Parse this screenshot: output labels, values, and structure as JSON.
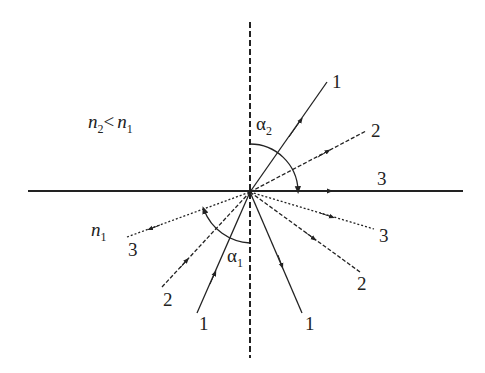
{
  "diagram": {
    "medium_condition": {
      "n": "n",
      "sub_a": "2",
      "op": "<",
      "n2": "n",
      "sub_b": "1"
    },
    "lower_medium": {
      "n": "n",
      "sub": "1"
    },
    "angles": {
      "upper": {
        "symbol": "α",
        "sub": "2"
      },
      "lower": {
        "symbol": "α",
        "sub": "1"
      }
    },
    "rays": {
      "upper_1": "1",
      "upper_2": "2",
      "surface_3": "3",
      "incident_1": "1",
      "incident_2": "2",
      "incident_3": "3",
      "reflected_1": "1",
      "reflected_2": "2",
      "reflected_3": "3"
    },
    "colors": {
      "stroke": "#222222",
      "background": "#ffffff"
    }
  }
}
